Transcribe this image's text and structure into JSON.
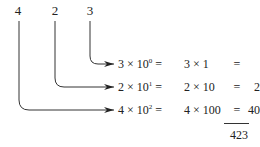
{
  "digits": [
    {
      "value": "4",
      "place": 2
    },
    {
      "value": "2",
      "place": 1
    },
    {
      "value": "3",
      "place": 0
    }
  ],
  "rows": [
    {
      "coef": "3",
      "base": "10",
      "exp": "0",
      "expanded": "3 × 1",
      "eq": "=",
      "result": "3"
    },
    {
      "coef": "2",
      "base": "10",
      "exp": "1",
      "expanded": "2 × 10",
      "eq": "=",
      "result": "20"
    },
    {
      "coef": "4",
      "base": "10",
      "exp": "2",
      "expanded": "4 × 100",
      "eq": "=",
      "result": "400"
    }
  ],
  "total": "423",
  "times": "×",
  "equals": "="
}
